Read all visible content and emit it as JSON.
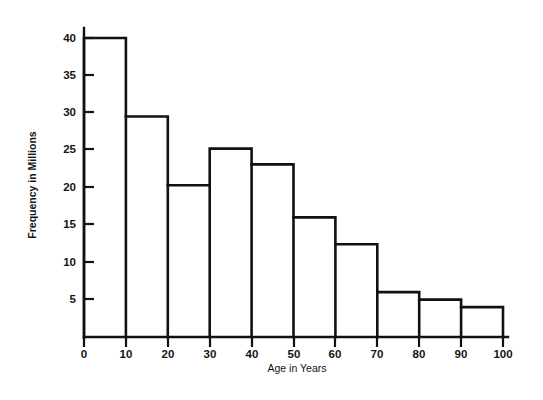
{
  "chart_data": {
    "type": "bar",
    "title": "",
    "subtitle": "",
    "xlabel": "Age in Years",
    "ylabel": "Frequency in Millions",
    "categories": [
      "0-10",
      "10-20",
      "20-30",
      "30-40",
      "40-50",
      "50-60",
      "60-70",
      "70-80",
      "80-90",
      "90-100"
    ],
    "bin_edges": [
      0,
      10,
      20,
      30,
      40,
      50,
      60,
      70,
      80,
      90,
      100
    ],
    "values": [
      40,
      29.5,
      20.3,
      25.2,
      23.1,
      16,
      12.4,
      6,
      5,
      4
    ],
    "xlim": [
      0,
      100
    ],
    "ylim": [
      0,
      41
    ],
    "xticks": [
      0,
      10,
      20,
      30,
      40,
      50,
      60,
      70,
      80,
      90,
      100
    ],
    "xtick_labels": [
      "0",
      "10",
      "20",
      "30",
      "40",
      "50",
      "60",
      "70",
      "80",
      "90",
      "100"
    ],
    "yticks": [
      5,
      10,
      15,
      20,
      25,
      30,
      35,
      40
    ],
    "ytick_labels": [
      "5",
      "10",
      "15",
      "20",
      "25",
      "30",
      "35",
      "40"
    ],
    "grid": false,
    "legend": null,
    "legend_position": "none",
    "series": [
      {
        "name": "Frequency in Millions",
        "values": [
          40,
          29.5,
          20.3,
          25.2,
          23.1,
          16,
          12.4,
          6,
          5,
          4
        ]
      }
    ],
    "style": {
      "line_color": "#111111",
      "fill_color": "#ffffff",
      "background": "#ffffff",
      "text_color": "#141414"
    }
  }
}
